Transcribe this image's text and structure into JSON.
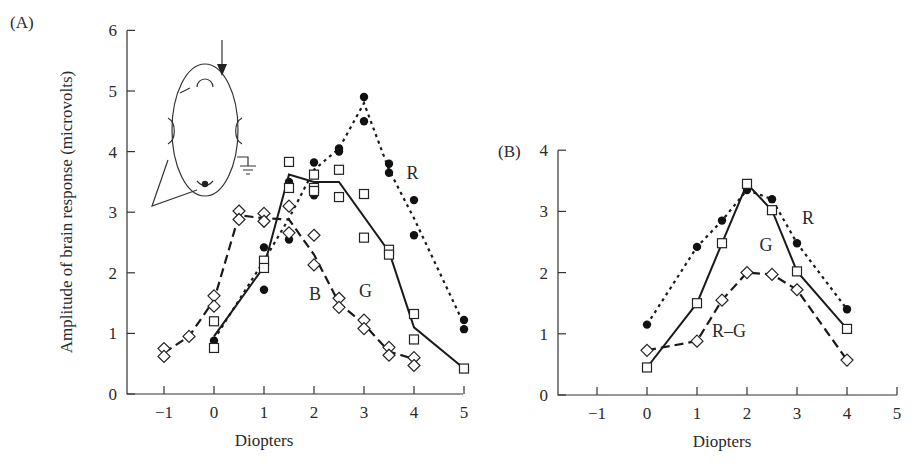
{
  "chart_data": [
    {
      "panel": "(A)",
      "type": "line",
      "title": "",
      "xlabel": "Diopters",
      "ylabel": "Amplitude of brain response (microvolts)",
      "xlim": [
        -1.5,
        5
      ],
      "ylim": [
        0,
        6
      ],
      "xticks": [
        -1,
        0,
        1,
        2,
        3,
        4,
        5
      ],
      "yticks": [
        0,
        1,
        2,
        3,
        4,
        5,
        6
      ],
      "grid": false,
      "legend": "inline labels",
      "series": [
        {
          "name": "R",
          "marker": "filled-circle",
          "line": "dotted",
          "line_points": [
            [
              0,
              0.9
            ],
            [
              1,
              2.2
            ],
            [
              1.5,
              2.9
            ],
            [
              2,
              3.7
            ],
            [
              2.5,
              4.05
            ],
            [
              3,
              4.8
            ],
            [
              3.5,
              3.7
            ],
            [
              4,
              2.9
            ],
            [
              5,
              1.15
            ]
          ],
          "points": [
            [
              0,
              0.88
            ],
            [
              1,
              2.42
            ],
            [
              1,
              1.72
            ],
            [
              1.5,
              3.5
            ],
            [
              1.5,
              2.55
            ],
            [
              2,
              3.82
            ],
            [
              2,
              3.28
            ],
            [
              2.5,
              4.05
            ],
            [
              2.5,
              4.0
            ],
            [
              3,
              4.9
            ],
            [
              3,
              4.5
            ],
            [
              3.5,
              3.8
            ],
            [
              3.5,
              3.65
            ],
            [
              4,
              3.2
            ],
            [
              4,
              2.62
            ],
            [
              5,
              1.22
            ],
            [
              5,
              1.07
            ]
          ]
        },
        {
          "name": "G",
          "marker": "open-square",
          "line": "solid",
          "line_points": [
            [
              0,
              0.95
            ],
            [
              1,
              2.1
            ],
            [
              1.5,
              3.62
            ],
            [
              2,
              3.5
            ],
            [
              2.5,
              3.5
            ],
            [
              3.5,
              2.35
            ],
            [
              4,
              1.1
            ],
            [
              5,
              0.42
            ]
          ],
          "points": [
            [
              0,
              1.2
            ],
            [
              0,
              0.76
            ],
            [
              1,
              2.2
            ],
            [
              1,
              2.08
            ],
            [
              1.5,
              3.83
            ],
            [
              1.5,
              3.4
            ],
            [
              2,
              3.62
            ],
            [
              2,
              3.4
            ],
            [
              2,
              3.35
            ],
            [
              2.5,
              3.7
            ],
            [
              2.5,
              3.25
            ],
            [
              3,
              3.3
            ],
            [
              3,
              2.58
            ],
            [
              3.5,
              2.38
            ],
            [
              3.5,
              2.3
            ],
            [
              4,
              1.32
            ],
            [
              4,
              0.9
            ],
            [
              5,
              0.42
            ]
          ]
        },
        {
          "name": "B",
          "marker": "open-diamond",
          "line": "dashed",
          "line_points": [
            [
              -1,
              0.68
            ],
            [
              -0.5,
              0.95
            ],
            [
              0,
              1.55
            ],
            [
              0.5,
              2.95
            ],
            [
              1,
              2.9
            ],
            [
              1.5,
              2.88
            ],
            [
              2,
              2.3
            ],
            [
              2.5,
              1.5
            ],
            [
              3,
              1.15
            ],
            [
              3.5,
              0.7
            ],
            [
              4,
              0.58
            ]
          ],
          "points": [
            [
              -1,
              0.75
            ],
            [
              -1,
              0.62
            ],
            [
              -0.5,
              0.95
            ],
            [
              0,
              1.62
            ],
            [
              0,
              1.45
            ],
            [
              0.5,
              3.02
            ],
            [
              0.5,
              2.88
            ],
            [
              1,
              2.98
            ],
            [
              1,
              2.85
            ],
            [
              1.5,
              3.1
            ],
            [
              1.5,
              2.66
            ],
            [
              2,
              2.62
            ],
            [
              2,
              2.13
            ],
            [
              2.5,
              1.58
            ],
            [
              2.5,
              1.43
            ],
            [
              3,
              1.22
            ],
            [
              3,
              1.08
            ],
            [
              3.5,
              0.77
            ],
            [
              3.5,
              0.64
            ],
            [
              4,
              0.6
            ],
            [
              4,
              0.47
            ]
          ]
        }
      ],
      "labels": [
        {
          "text": "R",
          "x": 3.85,
          "y": 3.55
        },
        {
          "text": "G",
          "x": 2.9,
          "y": 1.6
        },
        {
          "text": "B",
          "x": 1.9,
          "y": 1.55
        }
      ]
    },
    {
      "panel": "(B)",
      "type": "line",
      "title": "",
      "xlabel": "Diopters",
      "ylabel": "",
      "xlim": [
        -1.75,
        5
      ],
      "ylim": [
        0,
        4
      ],
      "xticks": [
        -1,
        0,
        1,
        2,
        3,
        4,
        5
      ],
      "yticks": [
        0,
        1,
        2,
        3,
        4
      ],
      "grid": false,
      "legend": "inline labels",
      "series": [
        {
          "name": "R",
          "marker": "filled-circle",
          "line": "dotted",
          "points": [
            [
              0,
              1.15
            ],
            [
              1,
              2.42
            ],
            [
              1.5,
              2.85
            ],
            [
              2,
              3.35
            ],
            [
              2.5,
              3.2
            ],
            [
              3,
              2.48
            ],
            [
              4,
              1.4
            ]
          ]
        },
        {
          "name": "G",
          "marker": "open-square",
          "line": "solid",
          "points": [
            [
              0,
              0.45
            ],
            [
              1,
              1.5
            ],
            [
              1.5,
              2.48
            ],
            [
              2,
              3.45
            ],
            [
              2.5,
              3.02
            ],
            [
              3,
              2.02
            ],
            [
              4,
              1.08
            ]
          ]
        },
        {
          "name": "R–G",
          "marker": "open-diamond",
          "line": "dashed",
          "points": [
            [
              0,
              0.73
            ],
            [
              1,
              0.88
            ],
            [
              1.5,
              1.55
            ],
            [
              2,
              2.0
            ],
            [
              2.5,
              1.97
            ],
            [
              3,
              1.72
            ],
            [
              4,
              0.57
            ]
          ]
        }
      ],
      "labels": [
        {
          "text": "R",
          "x": 3.1,
          "y": 2.8
        },
        {
          "text": "G",
          "x": 2.25,
          "y": 2.35
        },
        {
          "text": "R–G",
          "x": 1.3,
          "y": 0.95
        }
      ]
    }
  ],
  "figure": {
    "panel_a_label": "(A)",
    "panel_b_label": "(B)",
    "inset": "head-diagram-top-view-with-stimulus-arrow-and-occipital-electrode"
  }
}
